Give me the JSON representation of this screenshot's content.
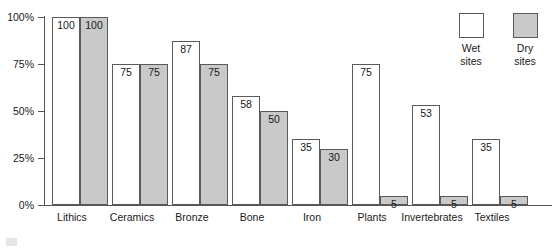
{
  "chart_data": {
    "type": "bar",
    "title": "",
    "subtitle": "",
    "xlabel": "",
    "ylabel": "",
    "ylim": [
      0,
      100
    ],
    "yticks": [
      "0%",
      "25%",
      "50%",
      "75%",
      "100%"
    ],
    "ytick_values": [
      0,
      25,
      50,
      75,
      100
    ],
    "grid": false,
    "legend_position": "top-right",
    "categories": [
      "Lithics",
      "Ceramics",
      "Bronze",
      "Bone",
      "Iron",
      "Plants",
      "Invertebrates",
      "Textiles"
    ],
    "series": [
      {
        "name": "Wet sites",
        "color": "#ffffff",
        "values": [
          100,
          75,
          87,
          58,
          35,
          75,
          53,
          35
        ]
      },
      {
        "name": "Dry sites",
        "color": "#c9c9c9",
        "values": [
          100,
          75,
          75,
          50,
          30,
          5,
          5,
          5
        ]
      }
    ]
  },
  "legend": {
    "items": [
      {
        "label_line1": "Wet",
        "label_line2": "sites",
        "swatch": "white-square-swatch"
      },
      {
        "label_line1": "Dry",
        "label_line2": "sites",
        "swatch": "gray-square-swatch"
      }
    ]
  }
}
